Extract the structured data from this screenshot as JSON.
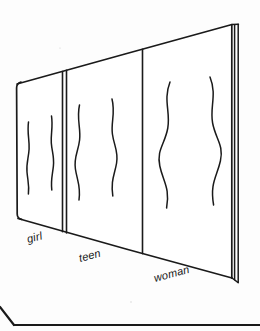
{
  "figure": {
    "style": {
      "ink_color": "#1a1a1a",
      "panel_fill": "#ffffff",
      "background_color": "#fdfdfd",
      "line_art": "hand-drawn"
    },
    "panels": [
      {
        "id": "panel-girl",
        "label": "girl",
        "label_position": {
          "x": 28,
          "y": 243
        },
        "order": 1,
        "silhouette": "narrow, nearly straight contours",
        "curve_amount": "slight"
      },
      {
        "id": "panel-teen",
        "label": "teen",
        "label_position": {
          "x": 80,
          "y": 262
        },
        "order": 2,
        "silhouette": "moderately curved contours",
        "curve_amount": "moderate"
      },
      {
        "id": "panel-woman",
        "label": "woman",
        "label_position": {
          "x": 155,
          "y": 282
        },
        "order": 3,
        "silhouette": "pronounced hourglass contours",
        "curve_amount": "pronounced"
      }
    ],
    "board": {
      "corners": {
        "top_left": {
          "x": 17,
          "y": 83
        },
        "top_right": {
          "x": 238,
          "y": 24
        },
        "bottom_right": {
          "x": 238,
          "y": 283
        },
        "bottom_left": {
          "x": 18,
          "y": 219
        }
      },
      "thickness_visible": true
    },
    "footer_rule": {
      "present": true,
      "description": "partial corner line of an element below the figure"
    }
  }
}
